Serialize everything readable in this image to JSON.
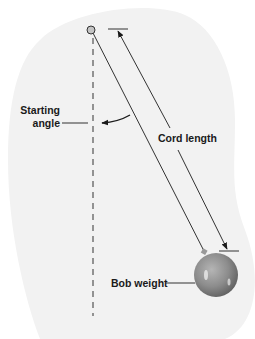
{
  "diagram": {
    "labels": {
      "starting_angle_line1": "Starting",
      "starting_angle_line2": "angle",
      "cord_length": "Cord length",
      "bob_weight": "Bob weight"
    },
    "parts": [
      "pivot",
      "vertical-reference-line",
      "cord",
      "bob",
      "cord-length-dimension",
      "starting-angle-arc"
    ],
    "colors": {
      "background": "#ffffff",
      "blob": "#f2f2f2",
      "line": "#333333",
      "dashed": "#777777",
      "bob": "#8a8a8a",
      "pivot": "#c4c4c4"
    }
  }
}
